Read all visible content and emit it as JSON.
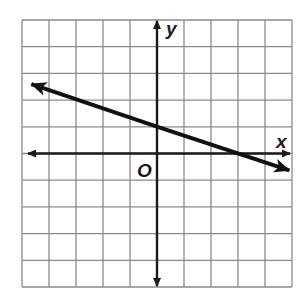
{
  "chart_data": {
    "type": "line",
    "title": "",
    "xlabel": "x",
    "ylabel": "y",
    "origin_label": "O",
    "grid": true,
    "xlim": [
      -5,
      5
    ],
    "ylim": [
      -5,
      5
    ],
    "grid_step": 1,
    "tick_labels": false,
    "series": [
      {
        "name": "line",
        "equation": "y = -x/3 + 1",
        "slope": -0.3333,
        "y_intercept": 1,
        "x_intercept": 3,
        "x": [
          -4.8,
          4.9
        ],
        "y": [
          2.6,
          -0.63
        ],
        "arrows": "both"
      }
    ]
  },
  "labels": {
    "x_axis": "x",
    "y_axis": "y",
    "origin": "O"
  },
  "colors": {
    "grid": "#8a8a8a",
    "axis": "#1a1a1a",
    "line": "#111111",
    "background": "#ffffff"
  }
}
